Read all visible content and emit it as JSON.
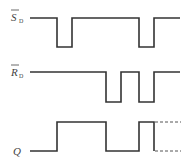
{
  "diagram": {
    "type": "timing-diagram",
    "time_marks": [
      "t0",
      "t1",
      "t2",
      "t3",
      "t4",
      "t5"
    ],
    "signals": [
      {
        "id": "SD",
        "label": "S",
        "subscript": "D",
        "overbar": true,
        "levels": [
          1,
          0,
          1,
          1,
          0,
          1
        ],
        "segments": [
          {
            "from": 0,
            "to": 1,
            "level": 1
          },
          {
            "from": 1,
            "to": 2,
            "level": 0
          },
          {
            "from": 2,
            "to": 4,
            "level": 1
          },
          {
            "from": 4,
            "to": 5,
            "level": 0
          },
          {
            "from": 5,
            "to": 6,
            "level": 1
          }
        ]
      },
      {
        "id": "RD",
        "label": "R",
        "subscript": "D",
        "overbar": true,
        "segments": [
          {
            "from": 0,
            "to": 3,
            "level": 1
          },
          {
            "from": 3,
            "to": 4,
            "level": 0
          },
          {
            "from": 4,
            "to": 4.5,
            "level": 1
          },
          {
            "from": 4.5,
            "to": 5,
            "level": 0
          },
          {
            "from": 5,
            "to": 6,
            "level": 1
          }
        ]
      },
      {
        "id": "Q",
        "label": "Q",
        "subscript": "",
        "overbar": false,
        "segments": [
          {
            "from": 0,
            "to": 1,
            "level": 0
          },
          {
            "from": 1,
            "to": 3,
            "level": 1
          },
          {
            "from": 3,
            "to": 4.5,
            "level": 0
          },
          {
            "from": 4.5,
            "to": 5,
            "level": 1
          }
        ],
        "indeterminate_after": 5
      }
    ]
  }
}
